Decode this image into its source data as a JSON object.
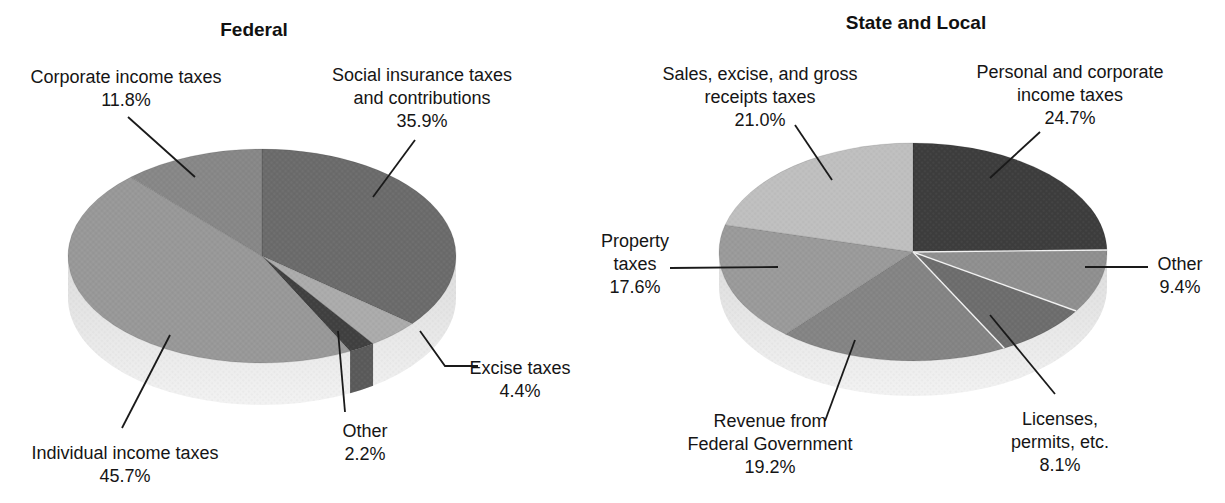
{
  "figure": {
    "background": "#ffffff",
    "text_color": "#151515",
    "leader_line_color": "#1a1a1a"
  },
  "chart_data": [
    {
      "type": "pie",
      "title": "Federal",
      "unit": "%",
      "start_angle_deg": -90,
      "clockwise": true,
      "categories": [
        "Social insurance taxes and contributions",
        "Excise taxes",
        "Other",
        "Individual income taxes",
        "Corporate income taxes"
      ],
      "values": [
        35.9,
        4.4,
        2.2,
        45.7,
        11.8
      ],
      "slices": [
        {
          "label": "Social insurance taxes and contributions",
          "value": 35.9,
          "pct_text": "35.9%",
          "color": "#6b6b6b",
          "label_lines": [
            "Social insurance taxes",
            "and contributions"
          ]
        },
        {
          "label": "Excise taxes",
          "value": 4.4,
          "pct_text": "4.4%",
          "color": "#ababab",
          "label_lines": [
            "Excise taxes"
          ]
        },
        {
          "label": "Other",
          "value": 2.2,
          "pct_text": "2.2%",
          "color": "#404040",
          "side_color": "#5a5a5a",
          "label_lines": [
            "Other"
          ]
        },
        {
          "label": "Individual income taxes",
          "value": 45.7,
          "pct_text": "45.7%",
          "color": "#989898",
          "label_lines": [
            "Individual income taxes"
          ]
        },
        {
          "label": "Corporate income taxes",
          "value": 11.8,
          "pct_text": "11.8%",
          "color": "#878787",
          "label_lines": [
            "Corporate income taxes"
          ]
        }
      ],
      "layout": {
        "pie": {
          "cx": 262,
          "cy": 256,
          "rx": 194,
          "ry": 107,
          "depth": 42,
          "rim_top": "#dcdcdc",
          "rim_bottom": "#f2f2f2"
        },
        "title_pos": {
          "x": 254,
          "y": 19
        },
        "labels": [
          {
            "x": 422,
            "y": 64,
            "align": "center",
            "leader": [
              [
                415,
                140
              ],
              [
                373,
                197
              ]
            ]
          },
          {
            "x": 520,
            "y": 357,
            "align": "center",
            "leader": [
              [
                478,
                366
              ],
              [
                445,
                366
              ],
              [
                420,
                331
              ]
            ]
          },
          {
            "x": 365,
            "y": 420,
            "align": "center",
            "leader": [
              [
                345,
                412
              ],
              [
                338,
                331
              ]
            ]
          },
          {
            "x": 125,
            "y": 442,
            "align": "center",
            "leader": [
              [
                122,
                428
              ],
              [
                170,
                335
              ]
            ]
          },
          {
            "x": 126,
            "y": 66,
            "align": "center",
            "leader": [
              [
                128,
                117
              ],
              [
                195,
                177
              ]
            ]
          }
        ]
      }
    },
    {
      "type": "pie",
      "title": "State and Local",
      "unit": "%",
      "start_angle_deg": -90,
      "clockwise": true,
      "categories": [
        "Personal and corporate income taxes",
        "Other",
        "Licenses, permits, etc.",
        "Revenue from Federal Government",
        "Property taxes",
        "Sales, excise, and gross receipts taxes"
      ],
      "values": [
        24.7,
        9.4,
        8.1,
        19.2,
        17.6,
        21.0
      ],
      "slices": [
        {
          "label": "Personal and corporate income taxes",
          "value": 24.7,
          "pct_text": "24.7%",
          "color": "#3d3d3d",
          "label_lines": [
            "Personal and corporate",
            "income taxes"
          ]
        },
        {
          "label": "Other",
          "value": 9.4,
          "pct_text": "9.4%",
          "color": "#8f8f8f",
          "sep_color": "#f2f2f2",
          "label_lines": [
            "Other"
          ]
        },
        {
          "label": "Licenses, permits, etc.",
          "value": 8.1,
          "pct_text": "8.1%",
          "color": "#6d6d6d",
          "sep_color": "#f2f2f2",
          "label_lines": [
            "Licenses,",
            "permits, etc."
          ]
        },
        {
          "label": "Revenue from Federal Government",
          "value": 19.2,
          "pct_text": "19.2%",
          "color": "#848484",
          "sep_color": "#f2f2f2",
          "label_lines": [
            "Revenue from",
            "Federal Government"
          ]
        },
        {
          "label": "Property taxes",
          "value": 17.6,
          "pct_text": "17.6%",
          "color": "#9a9a9a",
          "label_lines": [
            "Property",
            "taxes"
          ]
        },
        {
          "label": "Sales, excise, and gross receipts taxes",
          "value": 21.0,
          "pct_text": "21.0%",
          "color": "#bfbfbf",
          "label_lines": [
            "Sales, excise, and gross",
            "receipts taxes"
          ]
        }
      ],
      "layout": {
        "pie": {
          "cx": 913,
          "cy": 252,
          "rx": 194,
          "ry": 109,
          "depth": 35,
          "rim_top": "#dcdcdc",
          "rim_bottom": "#f2f2f2"
        },
        "title_pos": {
          "x": 916,
          "y": 12
        },
        "labels": [
          {
            "x": 1070,
            "y": 61,
            "align": "center",
            "leader": [
              [
                1040,
                132
              ],
              [
                990,
                178
              ]
            ]
          },
          {
            "x": 1180,
            "y": 253,
            "align": "center",
            "leader": [
              [
                1148,
                267
              ],
              [
                1085,
                267
              ]
            ]
          },
          {
            "x": 1060,
            "y": 408,
            "align": "center",
            "leader": [
              [
                1055,
                394
              ],
              [
                990,
                315
              ]
            ]
          },
          {
            "x": 770,
            "y": 410,
            "align": "center",
            "leader": [
              [
                825,
                421
              ],
              [
                855,
                340
              ]
            ]
          },
          {
            "x": 635,
            "y": 230,
            "align": "center",
            "leader": [
              [
                670,
                268
              ],
              [
                778,
                267
              ]
            ]
          },
          {
            "x": 760,
            "y": 63,
            "align": "center",
            "leader": [
              [
                795,
                125
              ],
              [
                832,
                180
              ]
            ]
          }
        ]
      }
    }
  ]
}
